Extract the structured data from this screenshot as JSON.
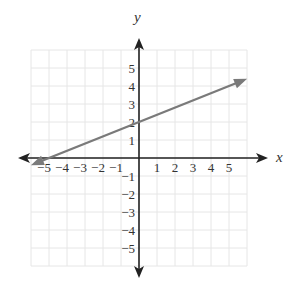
{
  "chart_data": {
    "type": "line",
    "title": "",
    "xlabel": "x",
    "ylabel": "y",
    "xlim": [
      -6,
      6
    ],
    "ylim": [
      -6,
      6
    ],
    "grid": true,
    "x_ticks": [
      "−5",
      "−4",
      "−3",
      "−2",
      "−1",
      "1",
      "2",
      "3",
      "4",
      "5"
    ],
    "y_ticks": [
      "5",
      "4",
      "3",
      "2",
      "1",
      "−1",
      "−2",
      "−3",
      "−4",
      "−5"
    ],
    "series": [
      {
        "name": "line",
        "equation": "y = 0.4x + 2",
        "slope": 0.4,
        "y_intercept": 2,
        "x": [
          -5.8,
          0,
          5.8
        ],
        "y": [
          -0.32,
          2,
          4.32
        ],
        "color": "#7a7a7a",
        "arrows": "both"
      }
    ]
  },
  "labels": {
    "x_axis": "x",
    "y_axis": "y"
  }
}
